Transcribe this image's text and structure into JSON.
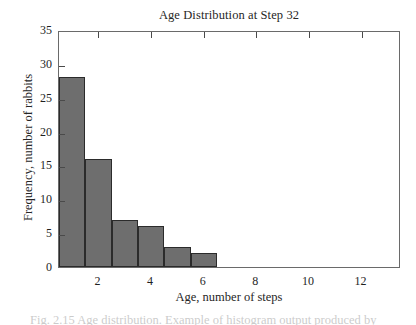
{
  "chart_data": {
    "type": "bar",
    "title": "Age Distribution at Step 32",
    "xlabel": "Age, number of steps",
    "ylabel": "Frequency, number of rabbits",
    "categories": [
      1,
      2,
      3,
      4,
      5,
      6
    ],
    "values": [
      28,
      16,
      7,
      6,
      3,
      2
    ],
    "bar_width": 1,
    "xlim": [
      0.5,
      13.5
    ],
    "ylim": [
      0,
      35
    ],
    "x_ticks": [
      2,
      4,
      6,
      8,
      10,
      12
    ],
    "x_tick_labels": [
      "2",
      "4",
      "6",
      "8",
      "10",
      "12"
    ],
    "y_ticks": [
      0,
      5,
      10,
      15,
      20,
      25,
      30,
      35
    ],
    "y_tick_labels": [
      "0",
      "5",
      "10",
      "15",
      "20",
      "25",
      "30",
      "35"
    ],
    "grid": false,
    "legend": null,
    "bar_color": "#6e6e6e",
    "bar_edge_color": "#2b2b2b",
    "frame_color": "#6a6a6a",
    "background": "#ffffff"
  },
  "caption": {
    "text": "Fig. 2.15  Age distribution.  Example of histogram output produced by"
  }
}
